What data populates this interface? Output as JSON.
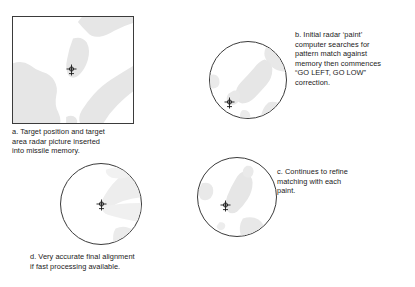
{
  "figure": {
    "background_color": "#ffffff",
    "ink_color": "#1a1a1a",
    "terrain_fill": "#e6e6e6",
    "terrain_fill_light": "#efefef",
    "outline_color": "#3b3b3b"
  },
  "panels": [
    {
      "id": "a",
      "shape": "square",
      "label": "scope-a-square",
      "caption": "a. Target position and target\narea radar picture inserted\ninto missile memory.",
      "marker": {
        "name": "target-marker-a",
        "x_pct": 49,
        "y_pct": 48
      }
    },
    {
      "id": "b",
      "shape": "circle",
      "label": "scope-b-circle",
      "caption": "b. Initial radar ‘paint’\ncomputer searches for\npattern match against\nmemory then commences\n“GO LEFT, GO LOW”\ncorrection.",
      "marker": {
        "name": "target-marker-b",
        "x_pct": 25,
        "y_pct": 77
      }
    },
    {
      "id": "c",
      "shape": "circle",
      "label": "scope-c-circle",
      "caption": "c. Continues to refine\nmatching with each\npaint.",
      "marker": {
        "name": "target-marker-c",
        "x_pct": 35,
        "y_pct": 59
      }
    },
    {
      "id": "d",
      "shape": "circle",
      "label": "scope-d-circle",
      "caption": "d. Very accurate final alignment\nif fast processing available.",
      "marker": {
        "name": "target-marker-d",
        "x_pct": 50,
        "y_pct": 49
      }
    }
  ]
}
